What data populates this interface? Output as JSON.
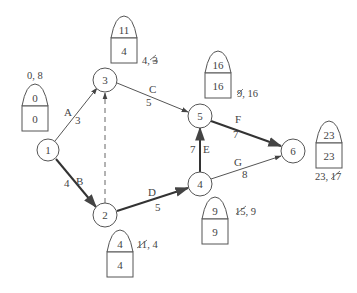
{
  "diagram": {
    "type": "activity-on-arrow project network (CPM)",
    "nodes": [
      {
        "id": "1",
        "label": "1",
        "cx": 48,
        "cy": 150
      },
      {
        "id": "2",
        "label": "2",
        "cx": 105,
        "cy": 215
      },
      {
        "id": "3",
        "label": "3",
        "cx": 105,
        "cy": 80
      },
      {
        "id": "4",
        "label": "4",
        "cx": 200,
        "cy": 184
      },
      {
        "id": "5",
        "label": "5",
        "cx": 200,
        "cy": 116
      },
      {
        "id": "6",
        "label": "6",
        "cx": 293,
        "cy": 151
      }
    ],
    "edges": [
      {
        "id": "A",
        "from": "1",
        "to": "3",
        "activity": "A",
        "duration": "3",
        "critical": false,
        "dummy": false
      },
      {
        "id": "B",
        "from": "1",
        "to": "2",
        "activity": "B",
        "duration": "4",
        "critical": true,
        "dummy": false
      },
      {
        "id": "C",
        "from": "3",
        "to": "5",
        "activity": "C",
        "duration": "5",
        "critical": false,
        "dummy": false
      },
      {
        "id": "D",
        "from": "2",
        "to": "4",
        "activity": "D",
        "duration": "5",
        "critical": true,
        "dummy": false
      },
      {
        "id": "E",
        "from": "4",
        "to": "5",
        "activity": "E",
        "duration": "7",
        "critical": true,
        "dummy": false
      },
      {
        "id": "F",
        "from": "5",
        "to": "6",
        "activity": "F",
        "duration": "7",
        "critical": true,
        "dummy": false
      },
      {
        "id": "G",
        "from": "4",
        "to": "6",
        "activity": "G",
        "duration": "8",
        "critical": false,
        "dummy": false
      },
      {
        "id": "dummy",
        "from": "2",
        "to": "3",
        "activity": "",
        "duration": "",
        "critical": false,
        "dummy": true
      }
    ],
    "event_boxes": [
      {
        "node": "1",
        "earliest": "0",
        "latest": "0",
        "annotation": "0, 8",
        "annotation_struck": "8"
      },
      {
        "node": "3",
        "earliest": "4",
        "latest": "11",
        "annotation": "4, 3",
        "annotation_struck": "3"
      },
      {
        "node": "5",
        "earliest": "16",
        "latest": "16",
        "annotation": "9, 16",
        "annotation_struck": "9"
      },
      {
        "node": "6",
        "earliest": "23",
        "latest": "23",
        "annotation": "23, 17",
        "annotation_struck": "17"
      },
      {
        "node": "2",
        "earliest": "4",
        "latest": "4",
        "annotation": "11, 4",
        "annotation_struck": "11"
      },
      {
        "node": "4",
        "earliest": "9",
        "latest": "9",
        "annotation": "15, 9",
        "annotation_struck": "15"
      }
    ],
    "labels": {
      "n1": "1",
      "n2": "2",
      "n3": "3",
      "n4": "4",
      "n5": "5",
      "n6": "6",
      "A": "A",
      "A_dur": "3",
      "B": "B",
      "B_dur": "4",
      "C": "C",
      "C_dur": "5",
      "D": "D",
      "D_dur": "5",
      "E": "E",
      "E_dur": "7",
      "F": "F",
      "F_dur": "7",
      "G": "G",
      "G_dur": "8",
      "box1_top": "0",
      "box1_bot": "0",
      "box3_top": "11",
      "box3_bot": "4",
      "box5_top": "16",
      "box5_bot": "16",
      "box6_top": "23",
      "box6_bot": "23",
      "box2_top": "4",
      "box2_bot": "4",
      "box4_top": "9",
      "box4_bot": "9",
      "ann1_a": "0, ",
      "ann1_b": "8",
      "ann3_a": "4, ",
      "ann3_b": "3",
      "ann5_a": "9",
      "ann5_b": ", 16",
      "ann6_a": "23, ",
      "ann6_b": "17",
      "ann2_a": "11",
      "ann2_b": ", 4",
      "ann4_a": "15",
      "ann4_b": ", 9"
    },
    "colors": {
      "line": "#555555",
      "critical_line": "#333333",
      "text": "#444444",
      "background": "#ffffff"
    }
  }
}
